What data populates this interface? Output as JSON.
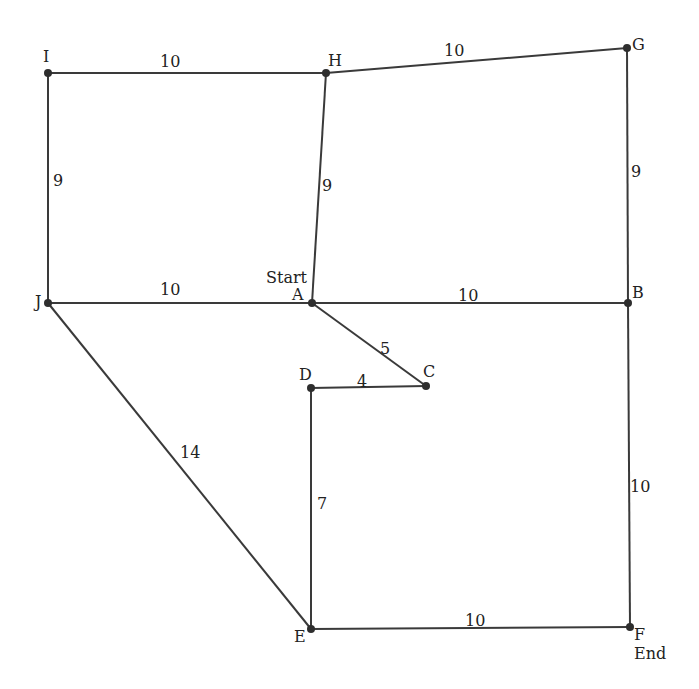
{
  "diagram": {
    "type": "weighted-graph",
    "nodes": [
      {
        "id": "A",
        "label": "A",
        "x": 312,
        "y": 303,
        "lx": 292,
        "ly": 300,
        "note": "Start",
        "nx": 266,
        "ny": 283
      },
      {
        "id": "B",
        "label": "B",
        "x": 628,
        "y": 303,
        "lx": 632,
        "ly": 298
      },
      {
        "id": "C",
        "label": "C",
        "x": 426,
        "y": 386,
        "lx": 423,
        "ly": 377
      },
      {
        "id": "D",
        "label": "D",
        "x": 311,
        "y": 388,
        "lx": 299,
        "ly": 380
      },
      {
        "id": "E",
        "label": "E",
        "x": 311,
        "y": 629,
        "lx": 294,
        "ly": 642
      },
      {
        "id": "F",
        "label": "F",
        "x": 630,
        "y": 627,
        "lx": 634,
        "ly": 640,
        "note": "End",
        "nx": 634,
        "ny": 659
      },
      {
        "id": "G",
        "label": "G",
        "x": 627,
        "y": 48,
        "lx": 632,
        "ly": 50
      },
      {
        "id": "H",
        "label": "H",
        "x": 326,
        "y": 73,
        "lx": 328,
        "ly": 66
      },
      {
        "id": "I",
        "label": "I",
        "x": 48,
        "y": 73,
        "lx": 43,
        "ly": 62
      },
      {
        "id": "J",
        "label": "J",
        "x": 48,
        "y": 303,
        "lx": 35,
        "ly": 307
      }
    ],
    "edges": [
      {
        "from": "I",
        "to": "H",
        "weight": "10",
        "lx": 160,
        "ly": 62
      },
      {
        "from": "H",
        "to": "G",
        "weight": "10",
        "lx": 444,
        "ly": 51
      },
      {
        "from": "I",
        "to": "J",
        "weight": "9",
        "lx": 53,
        "ly": 181
      },
      {
        "from": "H",
        "to": "A",
        "weight": "9",
        "lx": 322,
        "ly": 186
      },
      {
        "from": "G",
        "to": "B",
        "weight": "9",
        "lx": 631,
        "ly": 172
      },
      {
        "from": "J",
        "to": "A",
        "weight": "10",
        "lx": 160,
        "ly": 290
      },
      {
        "from": "A",
        "to": "B",
        "weight": "10",
        "lx": 458,
        "ly": 296
      },
      {
        "from": "A",
        "to": "C",
        "weight": "5",
        "lx": 380,
        "ly": 349
      },
      {
        "from": "D",
        "to": "C",
        "weight": "4",
        "lx": 357,
        "ly": 382
      },
      {
        "from": "J",
        "to": "E",
        "weight": "14",
        "lx": 180,
        "ly": 453
      },
      {
        "from": "D",
        "to": "E",
        "weight": "7",
        "lx": 317,
        "ly": 504
      },
      {
        "from": "B",
        "to": "F",
        "weight": "10",
        "lx": 630,
        "ly": 487
      },
      {
        "from": "E",
        "to": "F",
        "weight": "10",
        "lx": 465,
        "ly": 621
      }
    ],
    "start_label": "Start",
    "end_label": "End"
  }
}
